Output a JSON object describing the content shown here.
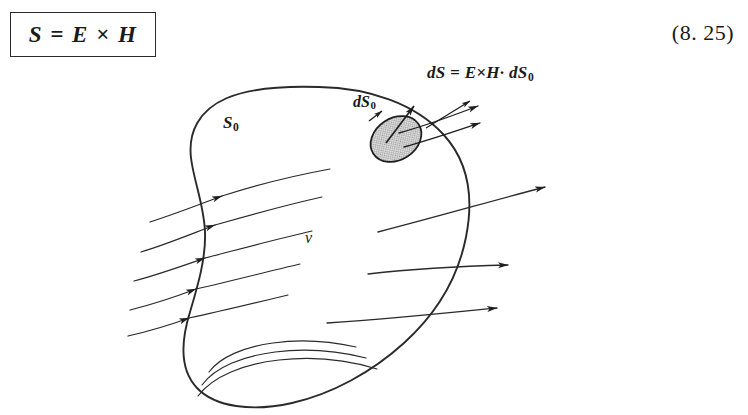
{
  "figure": {
    "equation_box": {
      "text": "S = E × H",
      "border_color": "#2a2a2a"
    },
    "equation_number": "(8. 25)",
    "labels": {
      "flux_element": "dS = E×H· dS",
      "flux_element_sub": "0",
      "surface_element": "dS",
      "surface_element_sub": "0",
      "closed_surface": "S",
      "closed_surface_sub": "0",
      "volume": "v"
    },
    "colors": {
      "ink": "#1a1a1a",
      "line": "#2a2a2a",
      "patch_fill": "#b8b8b8",
      "background": "#ffffff"
    },
    "diagram_description": "Closed surface S0 enclosing volume v with Poynting vector flow lines entering left and exiting right, and a shaded surface element dS0 on the upper right of the surface."
  }
}
